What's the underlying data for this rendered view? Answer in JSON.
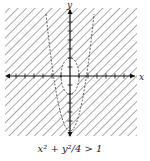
{
  "figure": {
    "type": "inequality-graph",
    "axes": {
      "x_label": "x",
      "y_label": "y"
    },
    "curves": [
      {
        "name": "ellipse",
        "equation": "x^2 + y^2/4 = 1",
        "style": "dashed"
      },
      {
        "name": "parabola",
        "style": "dashed"
      }
    ],
    "shading": "hatched region outside ellipse",
    "caption": "x² + y²/4 > 1",
    "colors": {
      "line": "#333333",
      "hatch": "#555555",
      "background": "#ffffff"
    }
  }
}
